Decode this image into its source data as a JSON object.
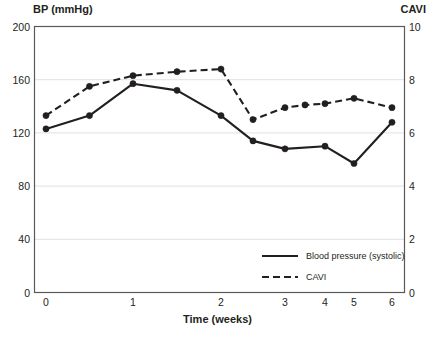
{
  "chart_data": {
    "type": "line",
    "title": "",
    "xlabel": "Time (weeks)",
    "ylabel": "BP (mmHg)",
    "y2label": "CAVI",
    "xlim": [
      0,
      6
    ],
    "ylim": [
      0,
      200
    ],
    "y2lim": [
      0,
      10
    ],
    "grid": true,
    "legend_position": "bottom-right",
    "x_ticks": [
      "0",
      "1",
      "2",
      "3",
      "4",
      "5",
      "6"
    ],
    "y_ticks": [
      "0",
      "40",
      "80",
      "120",
      "160",
      "200"
    ],
    "y2_ticks": [
      "0",
      "2",
      "4",
      "6",
      "8",
      "10"
    ],
    "x": [
      0,
      0.5,
      1,
      1.5,
      2,
      2.5,
      3,
      3.5,
      4,
      5,
      6
    ],
    "series": [
      {
        "name": "Blood pressure (systolic)",
        "axis": "left",
        "style": "solid",
        "color": "#231f20",
        "x": [
          0,
          0.5,
          1,
          1.5,
          2,
          2.5,
          3,
          4,
          5,
          6
        ],
        "values": [
          123,
          133,
          157,
          152,
          133,
          114,
          108,
          110,
          97,
          128
        ]
      },
      {
        "name": "CAVI",
        "axis": "right",
        "style": "dashed",
        "color": "#231f20",
        "x": [
          0,
          0.5,
          1,
          1.5,
          2,
          2.5,
          3,
          3.5,
          4,
          5,
          6
        ],
        "values": [
          6.65,
          7.75,
          8.15,
          8.3,
          8.4,
          6.5,
          6.95,
          7.05,
          7.1,
          7.3,
          6.95
        ]
      }
    ]
  },
  "axes": {
    "left_title": "BP (mmHg)",
    "right_title": "CAVI",
    "x_title": "Time (weeks)"
  },
  "legend": {
    "items": [
      {
        "label": "Blood pressure (systolic)"
      },
      {
        "label": "CAVI"
      }
    ]
  }
}
